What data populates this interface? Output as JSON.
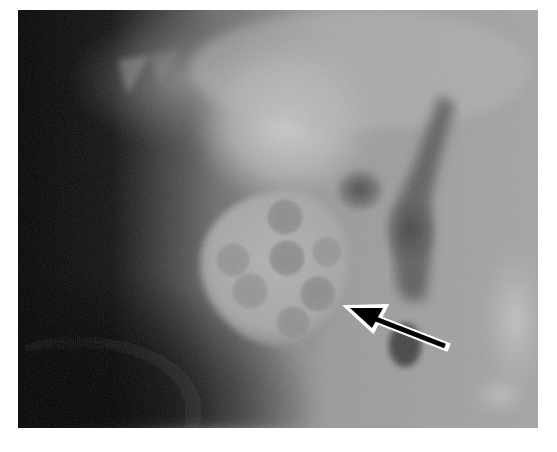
{
  "image": {
    "kind": "radiograph",
    "description": "Grayscale X-ray showing a rounded radiopaque object containing multiple circular lucencies, indicated by an arrow",
    "frame": {
      "x": 18,
      "y": 10,
      "width": 520,
      "height": 418
    },
    "colors": {
      "background": "#ffffff",
      "dark_region": "#050505",
      "mid_gray": "#8a8a8a",
      "light_gray": "#c4c4c4",
      "object_fill": "#a9a9a9",
      "lucency_fill": "#8e8e8e",
      "arrow_fill": "#000000",
      "arrow_outline": "#ffffff"
    }
  },
  "object": {
    "center": [
      285,
      270
    ],
    "lucencies": [
      {
        "name": "top",
        "cx": 285,
        "cy": 217,
        "r": 18
      },
      {
        "name": "center",
        "cx": 287,
        "cy": 258,
        "r": 18
      },
      {
        "name": "left",
        "cx": 233,
        "cy": 260,
        "r": 17
      },
      {
        "name": "right",
        "cx": 327,
        "cy": 252,
        "r": 15
      },
      {
        "name": "lower-left",
        "cx": 250,
        "cy": 291,
        "r": 18
      },
      {
        "name": "lower-right",
        "cx": 318,
        "cy": 294,
        "r": 18
      },
      {
        "name": "bottom",
        "cx": 293,
        "cy": 323,
        "r": 17
      }
    ]
  },
  "annotation": {
    "arrow": {
      "tip": [
        347,
        307
      ],
      "tail": [
        447,
        347
      ],
      "label": ""
    }
  },
  "caption": {
    "text": ""
  }
}
